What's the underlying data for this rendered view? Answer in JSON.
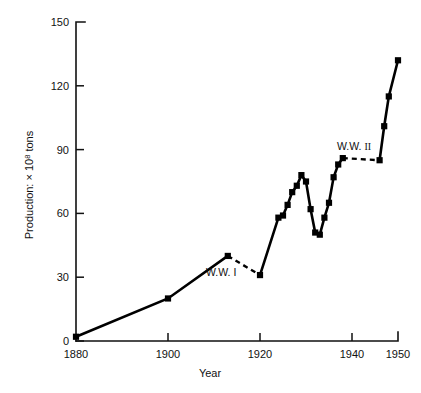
{
  "chart_data": {
    "type": "line",
    "title": "",
    "xlabel": "Year",
    "ylabel": "Production: × 10⁸ tons",
    "ylabel_prefix": "Production: × 10",
    "ylabel_exponent": "8",
    "ylabel_suffix": " tons",
    "xlim": [
      1880,
      1950
    ],
    "ylim": [
      0,
      150
    ],
    "grid": false,
    "legend": "none",
    "x_ticks": [
      1880,
      1900,
      1920,
      1940,
      1950
    ],
    "x_tick_labels": [
      "1880",
      "1900",
      "1920",
      "1940",
      "1950"
    ],
    "y_ticks": [
      0,
      30,
      60,
      90,
      120,
      150
    ],
    "y_tick_labels": [
      "0",
      "30",
      "60",
      "90",
      "120",
      "150"
    ],
    "series": [
      {
        "name": "World production",
        "marker": "square",
        "color": "#000000",
        "points": [
          {
            "x": 1880,
            "y": 2
          },
          {
            "x": 1900,
            "y": 20
          },
          {
            "x": 1913,
            "y": 40
          },
          {
            "x": 1920,
            "y": 31
          },
          {
            "x": 1924,
            "y": 58
          },
          {
            "x": 1925,
            "y": 59
          },
          {
            "x": 1926,
            "y": 64
          },
          {
            "x": 1927,
            "y": 70
          },
          {
            "x": 1928,
            "y": 73
          },
          {
            "x": 1929,
            "y": 78
          },
          {
            "x": 1930,
            "y": 75
          },
          {
            "x": 1931,
            "y": 62
          },
          {
            "x": 1932,
            "y": 51
          },
          {
            "x": 1933,
            "y": 50
          },
          {
            "x": 1934,
            "y": 58
          },
          {
            "x": 1935,
            "y": 65
          },
          {
            "x": 1936,
            "y": 77
          },
          {
            "x": 1937,
            "y": 83
          },
          {
            "x": 1938,
            "y": 86
          },
          {
            "x": 1946,
            "y": 85
          },
          {
            "x": 1947,
            "y": 101
          },
          {
            "x": 1948,
            "y": 115
          },
          {
            "x": 1950,
            "y": 132
          }
        ],
        "gaps": [
          {
            "from": 1913,
            "to": 1920,
            "label": "W.W. I"
          },
          {
            "from": 1938,
            "to": 1946,
            "label": "W.W. II"
          }
        ]
      }
    ],
    "annotations": [
      {
        "name": "ww1-label",
        "text": "W.W. I",
        "x": 1916,
        "y": 30
      },
      {
        "name": "ww2-label",
        "text": "W.W. II",
        "x": 1942,
        "y": 92
      }
    ]
  },
  "annotations": {
    "ww1": "W.W. I",
    "ww2_prefix": "W.W. ",
    "ww2_numeral": "II"
  },
  "axes": {
    "x_title": "Year",
    "y_title_prefix": "Production: × 10",
    "y_title_exponent": "8",
    "y_title_suffix": " tons"
  },
  "x_tick_labels": [
    "1880",
    "1900",
    "1920",
    "1940",
    "1950"
  ],
  "y_tick_labels": [
    "0",
    "30",
    "60",
    "90",
    "120",
    "150"
  ]
}
